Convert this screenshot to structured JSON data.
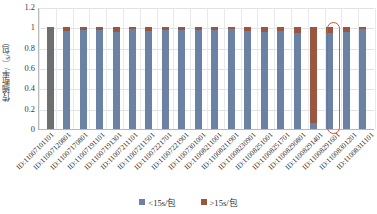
{
  "chart_data": {
    "type": "bar",
    "subtype": "stacked-bar-100",
    "title": "",
    "xlabel": "",
    "ylabel": "传输断率/（s/包）",
    "ylim": [
      0,
      1.2
    ],
    "yticks": [
      "0",
      "0.2",
      "0.4",
      "0.6",
      "0.8",
      "1",
      "1.2"
    ],
    "ytick_values": [
      0,
      0.2,
      0.4,
      0.6,
      0.8,
      1,
      1.2
    ],
    "grid": "horizontal-and-vertical",
    "legend_position": "bottom-center",
    "categories": [
      "ID:11007101101",
      "ID:11007120801",
      "ID:11007170801",
      "ID:11007191101",
      "ID:11007191301",
      "ID:11007211101",
      "ID:11007211501",
      "ID:11007221701",
      "ID:11007221901",
      "ID:11007301001",
      "ID:11008211001",
      "ID:11008211901",
      "ID:11008230901",
      "ID:11008251001",
      "ID:11008251701",
      "ID:11008290801",
      "ID:11008291401",
      "ID:11008291601",
      "ID:11008301201",
      "ID:11008311101"
    ],
    "series": [
      {
        "name": "<15s/包",
        "color": "#6b82a4",
        "values": [
          1.0,
          0.96,
          0.97,
          0.97,
          0.95,
          0.98,
          0.96,
          0.97,
          0.97,
          0.97,
          0.97,
          0.98,
          0.96,
          0.95,
          0.96,
          0.94,
          0.06,
          0.94,
          0.95,
          0.98
        ]
      },
      {
        "name": ">15s/包",
        "color": "#9a5740",
        "values": [
          0.0,
          0.04,
          0.03,
          0.03,
          0.05,
          0.02,
          0.04,
          0.03,
          0.03,
          0.03,
          0.03,
          0.02,
          0.04,
          0.05,
          0.04,
          0.06,
          0.94,
          0.06,
          0.05,
          0.02
        ]
      }
    ],
    "highlight": {
      "category_index": 17,
      "label": "ID:11008291601",
      "outline_color": "#d9503c",
      "shape": "rounded-rectangle"
    }
  },
  "legend": {
    "items": [
      {
        "label": "<15s/包",
        "color": "#6b82a4"
      },
      {
        "label": ">15s/包",
        "color": "#9a5740"
      }
    ]
  }
}
